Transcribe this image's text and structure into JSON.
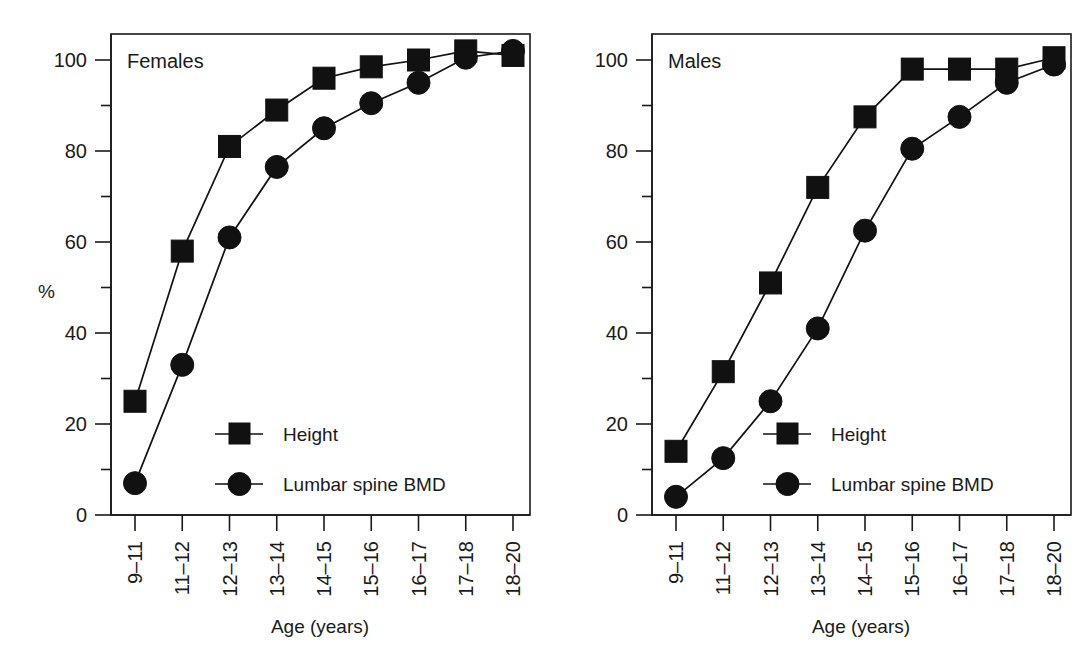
{
  "figure": {
    "panel_count": 2,
    "background_color": "#ffffff",
    "ink_color": "#111111"
  },
  "chart_data": [
    {
      "type": "line",
      "title": "Females",
      "xlabel": "Age (years)",
      "ylabel": "%",
      "categories": [
        "9–11",
        "11–12",
        "12–13",
        "13–14",
        "14–15",
        "15–16",
        "16–17",
        "17–18",
        "18–20"
      ],
      "ylim": [
        0,
        107
      ],
      "yticks": [
        0,
        20,
        40,
        60,
        80,
        100
      ],
      "ytick_labels": [
        "0",
        "20",
        "40",
        "60",
        "80",
        "100"
      ],
      "yminor_ticks": [
        10,
        30,
        50,
        70,
        90
      ],
      "grid": false,
      "legend_position": "inside-lower-center",
      "series": [
        {
          "name": "Height",
          "marker": "square",
          "values": [
            25,
            58,
            81,
            89,
            96,
            98.5,
            100,
            102,
            101
          ]
        },
        {
          "name": "Lumbar spine BMD",
          "marker": "circle",
          "values": [
            7,
            33,
            61,
            76.5,
            85,
            90.5,
            95,
            100.5,
            102
          ]
        }
      ]
    },
    {
      "type": "line",
      "title": "Males",
      "xlabel": "Age (years)",
      "ylabel": "",
      "categories": [
        "9–11",
        "11–12",
        "12–13",
        "13–14",
        "14–15",
        "15–16",
        "16–17",
        "17–18",
        "18–20"
      ],
      "ylim": [
        0,
        107
      ],
      "yticks": [
        0,
        20,
        40,
        60,
        80,
        100
      ],
      "ytick_labels": [
        "0",
        "20",
        "40",
        "60",
        "80",
        "100"
      ],
      "yminor_ticks": [
        10,
        30,
        50,
        70,
        90
      ],
      "grid": false,
      "legend_position": "inside-lower-center",
      "series": [
        {
          "name": "Height",
          "marker": "square",
          "values": [
            14,
            31.5,
            51,
            72,
            87.5,
            98,
            98,
            98,
            100.5
          ]
        },
        {
          "name": "Lumbar spine BMD",
          "marker": "circle",
          "values": [
            4,
            12.5,
            25,
            41,
            62.5,
            80.5,
            87.5,
            95,
            99
          ]
        }
      ]
    }
  ],
  "panels": {
    "females": {
      "title": "Females",
      "y_axis_label": "%",
      "x_axis_label": "Age (years)",
      "ytick_labels": [
        "100",
        "80",
        "60",
        "40",
        "20",
        "0"
      ],
      "xtick_labels": [
        "9–11",
        "11–12",
        "12–13",
        "13–14",
        "14–15",
        "15–16",
        "16–17",
        "17–18",
        "18–20"
      ],
      "legend": {
        "height_label": "Height",
        "bmd_label": "Lumbar spine BMD"
      }
    },
    "males": {
      "title": "Males",
      "y_axis_label": "",
      "x_axis_label": "Age (years)",
      "ytick_labels": [
        "100",
        "80",
        "60",
        "40",
        "20",
        "0"
      ],
      "xtick_labels": [
        "9–11",
        "11–12",
        "12–13",
        "13–14",
        "14–15",
        "15–16",
        "16–17",
        "17–18",
        "18–20"
      ],
      "legend": {
        "height_label": "Height",
        "bmd_label": "Lumbar spine BMD"
      }
    }
  }
}
